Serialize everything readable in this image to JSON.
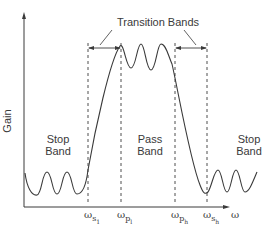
{
  "diagram": {
    "title": "Transition Bands",
    "y_axis_label": "Gain",
    "x_axis_label": "ω",
    "regions": [
      {
        "name": "stop-band-left",
        "line1": "Stop",
        "line2": "Band"
      },
      {
        "name": "pass-band",
        "line1": "Pass",
        "line2": "Band"
      },
      {
        "name": "stop-band-right",
        "line1": "Stop",
        "line2": "Band"
      }
    ],
    "markers": [
      {
        "base": "ω",
        "sub": "s",
        "subsub": "1"
      },
      {
        "base": "ω",
        "sub": "p",
        "subsub": "l"
      },
      {
        "base": "ω",
        "sub": "p",
        "subsub": "h"
      },
      {
        "base": "ω",
        "sub": "s",
        "subsub": "h"
      }
    ],
    "colors": {
      "line": "#3a3a3a",
      "background": "#ffffff"
    }
  }
}
